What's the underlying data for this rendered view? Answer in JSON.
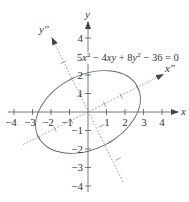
{
  "figure": {
    "equation": {
      "parts": [
        "5",
        "x",
        "2",
        " − 4",
        "xy",
        " + 8",
        "y",
        "2",
        " − 36 = 0"
      ]
    },
    "axes": {
      "x_label": "x",
      "y_label": "y",
      "x_rot_label": "x''",
      "y_rot_label": "y''",
      "x_ticks": [
        "−4",
        "−3",
        "−2",
        "−1",
        "1",
        "2",
        "3",
        "4"
      ],
      "y_ticks_pos": [
        "1",
        "2",
        "3",
        "4"
      ],
      "y_ticks_neg": [
        "−1",
        "−2",
        "−3",
        "−4"
      ]
    },
    "ellipse": {
      "semi_major": 3,
      "semi_minor": 2,
      "rotation_deg": 26.57
    },
    "colors": {
      "axis": "#555555",
      "curve": "#666666",
      "rotated_axis": "#999999",
      "text": "#333333"
    }
  }
}
